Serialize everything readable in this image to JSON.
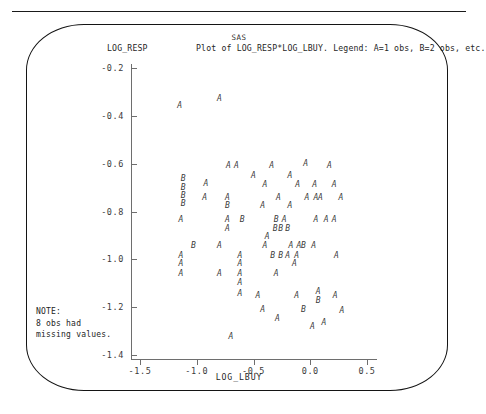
{
  "banner": "SAS",
  "title": "Plot of LOG_RESP*LOG_LBUY. Legend: A=1 obs, B=2 obs, etc.",
  "y_axis_name": "LOG_RESP",
  "x_axis_name": "LOG_LBUY",
  "note": "NOTE:\n8 obs had\nmissing values.",
  "colors": {
    "ink": "#1a1a1a",
    "axis": "#6e6e6e",
    "marker": "#3a3a3a",
    "background": "#ffffff"
  },
  "chart_data": {
    "type": "scatter",
    "title": "Plot of LOG_RESP*LOG_LBUY. Legend: A=1 obs, B=2 obs, etc.",
    "subtitle": "SAS",
    "xlabel": "LOG_LBUY",
    "ylabel": "LOG_RESP",
    "grid": false,
    "legend": "A=1 obs, B=2 obs, etc.",
    "note": "8 obs had missing values.",
    "xlim": [
      -1.62,
      0.62
    ],
    "ylim": [
      -1.44,
      -0.16
    ],
    "xticks": [
      -1.5,
      -1.0,
      -0.5,
      0.0,
      0.5
    ],
    "xticklabels": [
      "-1.5",
      "-1.0",
      "-0.5",
      "0.0",
      "0.5"
    ],
    "yticks": [
      -0.2,
      -0.4,
      -0.6,
      -0.8,
      -1.0,
      -1.2,
      -1.4
    ],
    "yticklabels": [
      "-0.2",
      "-0.4",
      "-0.6",
      "-0.8",
      "-1.0",
      "-1.2",
      "-1.4"
    ],
    "marker_legend": {
      "A": 1,
      "B": 2
    },
    "points": [
      {
        "x": -0.8,
        "y": -0.33,
        "label": "A"
      },
      {
        "x": -1.15,
        "y": -0.36,
        "label": "A"
      },
      {
        "x": -0.72,
        "y": -0.61,
        "label": "A"
      },
      {
        "x": -0.65,
        "y": -0.61,
        "label": "A"
      },
      {
        "x": -0.34,
        "y": -0.61,
        "label": "A"
      },
      {
        "x": -0.04,
        "y": -0.6,
        "label": "A"
      },
      {
        "x": 0.17,
        "y": -0.61,
        "label": "A"
      },
      {
        "x": -0.5,
        "y": -0.65,
        "label": "A"
      },
      {
        "x": -0.18,
        "y": -0.65,
        "label": "A"
      },
      {
        "x": -1.12,
        "y": -0.665,
        "label": "B"
      },
      {
        "x": -1.12,
        "y": -0.7,
        "label": "B"
      },
      {
        "x": -1.12,
        "y": -0.735,
        "label": "B"
      },
      {
        "x": -1.12,
        "y": -0.77,
        "label": "B"
      },
      {
        "x": -0.92,
        "y": -0.685,
        "label": "A"
      },
      {
        "x": -0.4,
        "y": -0.69,
        "label": "A"
      },
      {
        "x": -0.11,
        "y": -0.69,
        "label": "A"
      },
      {
        "x": 0.04,
        "y": -0.69,
        "label": "A"
      },
      {
        "x": 0.21,
        "y": -0.69,
        "label": "A"
      },
      {
        "x": -0.93,
        "y": -0.745,
        "label": "A"
      },
      {
        "x": -0.73,
        "y": -0.745,
        "label": "A"
      },
      {
        "x": -0.28,
        "y": -0.745,
        "label": "A"
      },
      {
        "x": -0.03,
        "y": -0.745,
        "label": "A"
      },
      {
        "x": 0.05,
        "y": -0.745,
        "label": "A"
      },
      {
        "x": 0.09,
        "y": -0.745,
        "label": "A"
      },
      {
        "x": 0.27,
        "y": -0.745,
        "label": "A"
      },
      {
        "x": -0.73,
        "y": -0.775,
        "label": "B"
      },
      {
        "x": -0.42,
        "y": -0.775,
        "label": "A"
      },
      {
        "x": -0.18,
        "y": -0.775,
        "label": "A"
      },
      {
        "x": -1.14,
        "y": -0.835,
        "label": "A"
      },
      {
        "x": -0.73,
        "y": -0.835,
        "label": "A"
      },
      {
        "x": -0.6,
        "y": -0.835,
        "label": "B"
      },
      {
        "x": -0.3,
        "y": -0.835,
        "label": "B"
      },
      {
        "x": -0.23,
        "y": -0.835,
        "label": "A"
      },
      {
        "x": 0.05,
        "y": -0.835,
        "label": "A"
      },
      {
        "x": 0.14,
        "y": -0.835,
        "label": "A"
      },
      {
        "x": 0.21,
        "y": -0.835,
        "label": "A"
      },
      {
        "x": -0.73,
        "y": -0.875,
        "label": "A"
      },
      {
        "x": -0.31,
        "y": -0.875,
        "label": "B"
      },
      {
        "x": -0.26,
        "y": -0.875,
        "label": "B"
      },
      {
        "x": -0.2,
        "y": -0.875,
        "label": "B"
      },
      {
        "x": -0.38,
        "y": -0.905,
        "label": "A"
      },
      {
        "x": -1.03,
        "y": -0.945,
        "label": "B"
      },
      {
        "x": -0.8,
        "y": -0.945,
        "label": "A"
      },
      {
        "x": -0.4,
        "y": -0.945,
        "label": "A"
      },
      {
        "x": -0.17,
        "y": -0.945,
        "label": "A"
      },
      {
        "x": -0.1,
        "y": -0.945,
        "label": "A"
      },
      {
        "x": -0.06,
        "y": -0.945,
        "label": "B"
      },
      {
        "x": 0.03,
        "y": -0.945,
        "label": "A"
      },
      {
        "x": -1.14,
        "y": -0.985,
        "label": "A"
      },
      {
        "x": -0.62,
        "y": -0.985,
        "label": "A"
      },
      {
        "x": -0.33,
        "y": -0.985,
        "label": "B"
      },
      {
        "x": -0.26,
        "y": -0.985,
        "label": "B"
      },
      {
        "x": -0.2,
        "y": -0.985,
        "label": "A"
      },
      {
        "x": -0.12,
        "y": -0.985,
        "label": "A"
      },
      {
        "x": 0.23,
        "y": -0.985,
        "label": "A"
      },
      {
        "x": -1.14,
        "y": -1.02,
        "label": "A"
      },
      {
        "x": -0.62,
        "y": -1.02,
        "label": "A"
      },
      {
        "x": -0.14,
        "y": -1.02,
        "label": "A"
      },
      {
        "x": -1.14,
        "y": -1.06,
        "label": "A"
      },
      {
        "x": -0.8,
        "y": -1.06,
        "label": "A"
      },
      {
        "x": -0.62,
        "y": -1.06,
        "label": "A"
      },
      {
        "x": -0.3,
        "y": -1.06,
        "label": "A"
      },
      {
        "x": -0.62,
        "y": -1.1,
        "label": "A"
      },
      {
        "x": -0.62,
        "y": -1.145,
        "label": "A"
      },
      {
        "x": 0.07,
        "y": -1.135,
        "label": "A"
      },
      {
        "x": 0.07,
        "y": -1.175,
        "label": "B"
      },
      {
        "x": -0.46,
        "y": -1.155,
        "label": "A"
      },
      {
        "x": -0.12,
        "y": -1.155,
        "label": "A"
      },
      {
        "x": 0.22,
        "y": -1.155,
        "label": "A"
      },
      {
        "x": -0.42,
        "y": -1.21,
        "label": "A"
      },
      {
        "x": -0.06,
        "y": -1.21,
        "label": "B"
      },
      {
        "x": 0.28,
        "y": -1.215,
        "label": "A"
      },
      {
        "x": -0.29,
        "y": -1.25,
        "label": "A"
      },
      {
        "x": 0.12,
        "y": -1.265,
        "label": "A"
      },
      {
        "x": 0.02,
        "y": -1.285,
        "label": "A"
      },
      {
        "x": -0.7,
        "y": -1.325,
        "label": "A"
      }
    ]
  }
}
